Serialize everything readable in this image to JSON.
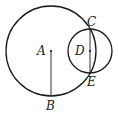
{
  "diagram": {
    "title": "",
    "points": {
      "A": {
        "label": "A",
        "x": 51,
        "y": 51
      },
      "B": {
        "label": "B",
        "x": 51,
        "y": 96
      },
      "C": {
        "label": "C",
        "x": 90,
        "y": 29
      },
      "D": {
        "label": "D",
        "x": 90,
        "y": 51
      },
      "E": {
        "label": "E",
        "x": 90,
        "y": 73
      }
    },
    "circles": [
      {
        "name": "circle-A",
        "center": "A",
        "radius": 45
      },
      {
        "name": "circle-D",
        "center": "D",
        "radius": 22
      }
    ],
    "segments": [
      {
        "name": "segment-AB",
        "from": "A",
        "to": "B"
      },
      {
        "name": "segment-CE",
        "from": "C",
        "to": "E"
      }
    ],
    "stroke_color": "#1a1a1a"
  }
}
